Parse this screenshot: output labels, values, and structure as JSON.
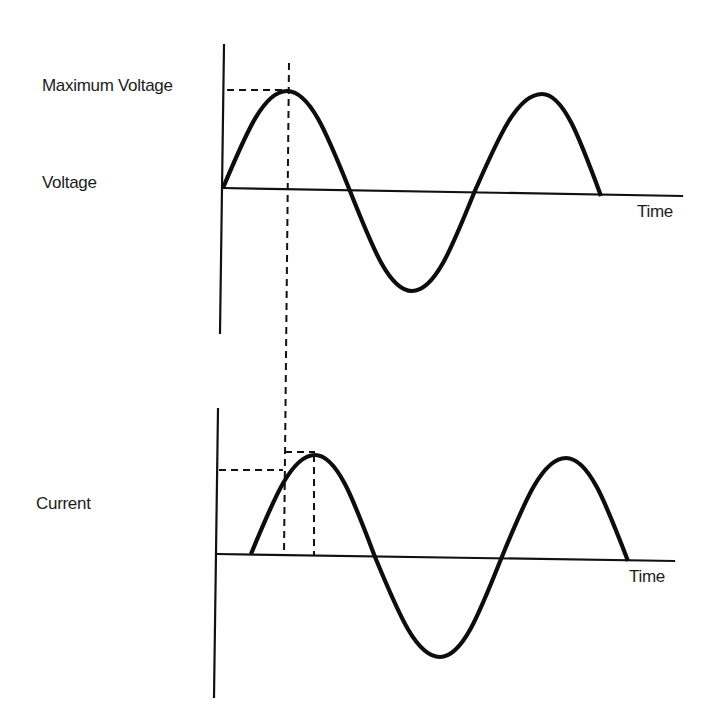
{
  "labels": {
    "max_voltage": "Maximum Voltage",
    "voltage": "Voltage",
    "current": "Current",
    "time_top": "Time",
    "time_bottom": "Time"
  },
  "colors": {
    "background": "#ffffff",
    "ink": "#111111"
  },
  "panels": {
    "voltage": {
      "y_axis": {
        "x1": 224,
        "y1": 45,
        "x2": 220,
        "y2": 333
      },
      "x_axis": {
        "x1": 223,
        "y1": 188,
        "x2": 682,
        "y2": 196
      },
      "wave_points": [
        [
          223,
          188
        ],
        [
          287,
          91
        ],
        [
          350,
          191
        ],
        [
          412,
          291
        ],
        [
          474,
          193
        ],
        [
          542,
          94
        ],
        [
          601,
          196
        ]
      ],
      "dashed_lines": [
        {
          "name": "max-voltage-level",
          "x1": 227,
          "y1": 90,
          "x2": 289,
          "y2": 90
        },
        {
          "name": "peak-time-marker",
          "x1": 289,
          "y1": 63,
          "x2": 284,
          "y2": 555
        }
      ]
    },
    "current": {
      "y_axis": {
        "x1": 218,
        "y1": 409,
        "x2": 214,
        "y2": 697
      },
      "x_axis": {
        "x1": 217,
        "y1": 554,
        "x2": 674,
        "y2": 561
      },
      "wave_points": [
        [
          251,
          554
        ],
        [
          315,
          455
        ],
        [
          375,
          557
        ],
        [
          440,
          657
        ],
        [
          501,
          559
        ],
        [
          566,
          458
        ],
        [
          628,
          561
        ]
      ],
      "dashed_lines": [
        {
          "name": "current-at-voltage-peak-level",
          "x1": 219,
          "y1": 470,
          "x2": 283,
          "y2": 470
        },
        {
          "name": "current-peak-level",
          "x1": 285,
          "y1": 452,
          "x2": 315,
          "y2": 452
        },
        {
          "name": "current-peak-time-marker",
          "x1": 314,
          "y1": 455,
          "x2": 314,
          "y2": 555
        }
      ]
    }
  },
  "label_positions": {
    "max_voltage": {
      "left": 42,
      "top": 77
    },
    "voltage": {
      "left": 42,
      "top": 174
    },
    "current": {
      "left": 36,
      "top": 495
    },
    "time_top": {
      "left": 637,
      "top": 203
    },
    "time_bottom": {
      "left": 629,
      "top": 568
    }
  }
}
